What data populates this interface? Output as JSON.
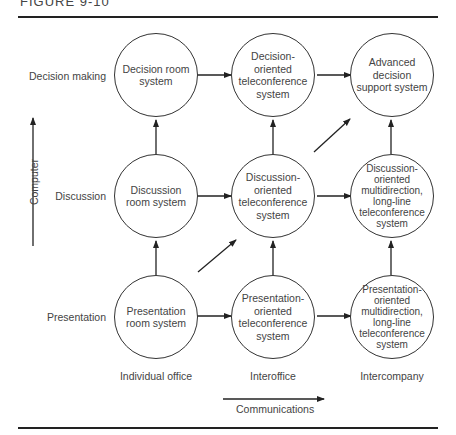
{
  "figure": {
    "title": "FIGURE 9-10"
  },
  "rows": [
    {
      "label": "Decision making"
    },
    {
      "label": "Discussion"
    },
    {
      "label": "Presentation"
    }
  ],
  "columns": [
    {
      "label": "Individual office"
    },
    {
      "label": "Interoffice"
    },
    {
      "label": "Intercompany"
    }
  ],
  "axes": {
    "vertical": "Computer",
    "horizontal": "Communications"
  },
  "nodes": {
    "r0c0": "Decision room system",
    "r0c1": "Decision-oriented teleconference system",
    "r0c2": "Advanced decision support system",
    "r1c0": "Discussion room system",
    "r1c1": "Discussion-oriented teleconference system",
    "r1c2": "Discussion-oriented multidirection, long-line teleconference system",
    "r2c0": "Presentation room system",
    "r2c1": "Presentation-oriented teleconference system",
    "r2c2": "Presentation-oriented multidirection, long-line teleconference system"
  }
}
